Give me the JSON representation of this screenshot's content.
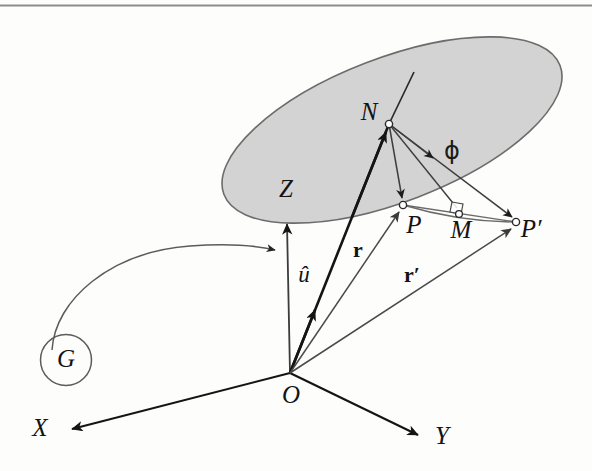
{
  "figure": {
    "caption_rule": true,
    "background": "#fdfdfc",
    "ink": "#131313",
    "plane_fill": "#cccccc",
    "plane_stroke": "#6f6f6f",
    "thin_stroke": "#555555"
  },
  "labels": {
    "axis_x": "X",
    "axis_y": "Y",
    "axis_z": "Z",
    "origin": "O",
    "point_n": "N",
    "point_p": "P",
    "point_m": "M",
    "point_p_prime": "P′",
    "group": "G",
    "unit_vector": "û",
    "vector_r": "r",
    "vector_r_prime": "r′",
    "angle_phi": "ϕ"
  },
  "geometry": {
    "origin": {
      "x": 290,
      "y": 373
    },
    "axis_x_tip": {
      "x": 66,
      "y": 430
    },
    "axis_y_tip": {
      "x": 424,
      "y": 437
    },
    "axis_z_tip": {
      "x": 287,
      "y": 216
    },
    "point_n": {
      "x": 389,
      "y": 124
    },
    "point_p": {
      "x": 403,
      "y": 205
    },
    "point_m": {
      "x": 459,
      "y": 214
    },
    "point_p_prime": {
      "x": 516,
      "y": 222
    },
    "group_circle": {
      "cx": 66,
      "cy": 360,
      "r": 25
    },
    "plane_ellipse": {
      "cx": 392,
      "cy": 130,
      "rx": 180,
      "ry": 72,
      "rotation_deg": -21
    }
  },
  "label_positions": {
    "axis_x": {
      "x": 40,
      "y": 430
    },
    "axis_y": {
      "x": 442,
      "y": 438
    },
    "axis_z": {
      "x": 286,
      "y": 191
    },
    "origin": {
      "x": 291,
      "y": 396
    },
    "point_n": {
      "x": 369,
      "y": 114
    },
    "point_p": {
      "x": 414,
      "y": 227
    },
    "point_m": {
      "x": 460,
      "y": 231
    },
    "point_p_prime": {
      "x": 530,
      "y": 231
    },
    "group": {
      "x": 66,
      "y": 361
    },
    "unit_vector": {
      "x": 304,
      "y": 277
    },
    "vector_r": {
      "x": 358,
      "y": 252
    },
    "vector_r_prime": {
      "x": 412,
      "y": 277
    },
    "angle_phi": {
      "x": 452,
      "y": 152
    }
  },
  "description": {
    "title": "Rotation of a point about an axis through the origin",
    "summary": "Point P is rotated by angle ϕ about the unit axis û to give P′. N is the foot of the axis inside the rotation plane, M is the midpoint of the chord PP′. Position vectors r and r′ run from origin O to P and P′."
  }
}
